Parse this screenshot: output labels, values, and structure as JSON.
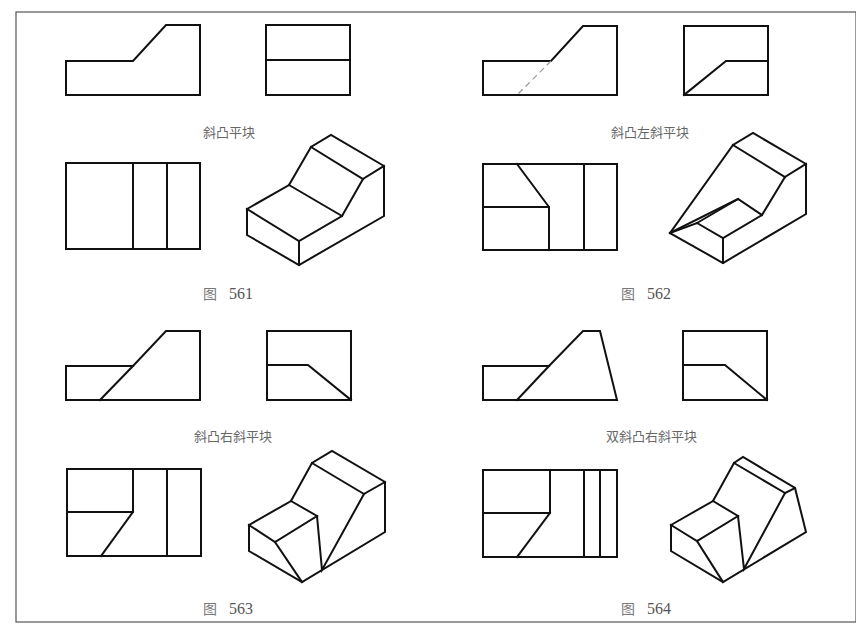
{
  "figures": [
    {
      "id": "561",
      "figure_prefix": "图",
      "figure_number": "561",
      "caption": "斜凸平块",
      "views": [
        "front-view",
        "side-view",
        "top-view",
        "isometric-view"
      ]
    },
    {
      "id": "562",
      "figure_prefix": "图",
      "figure_number": "562",
      "caption": "斜凸左斜平块",
      "views": [
        "front-view",
        "side-view",
        "top-view",
        "isometric-view"
      ]
    },
    {
      "id": "563",
      "figure_prefix": "图",
      "figure_number": "563",
      "caption": "斜凸右斜平块",
      "views": [
        "front-view",
        "side-view",
        "top-view",
        "isometric-view"
      ]
    },
    {
      "id": "564",
      "figure_prefix": "图",
      "figure_number": "564",
      "caption": "双斜凸右斜平块",
      "views": [
        "front-view",
        "side-view",
        "top-view",
        "isometric-view"
      ]
    }
  ],
  "colors": {
    "line": "#111111",
    "frame": "#555555",
    "caption": "#666666",
    "background": "#ffffff"
  }
}
